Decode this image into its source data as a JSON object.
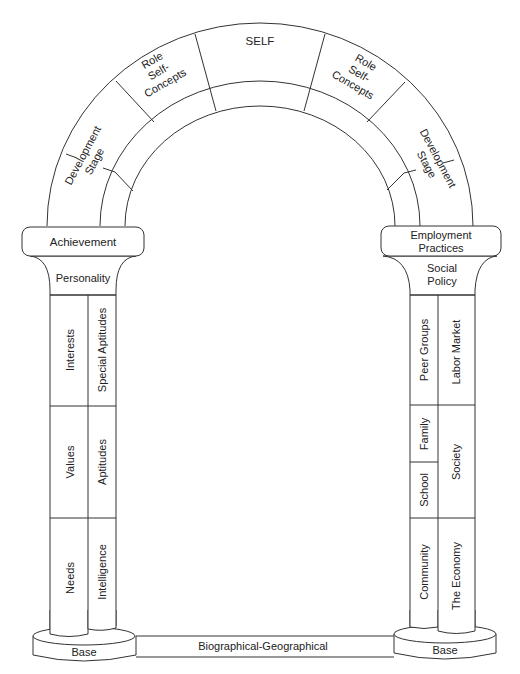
{
  "diagram": {
    "type": "archway",
    "arch": {
      "keystone": "SELF",
      "left_segments": [
        "Role Self-Concepts",
        "Development Stage"
      ],
      "right_segments": [
        "Role Self-Concepts",
        "Development Stage"
      ],
      "labels": {
        "self": "SELF",
        "role_left": [
          "Role",
          "Self-",
          "Concepts"
        ],
        "role_right": [
          "Role",
          "Self-",
          "Concepts"
        ],
        "dev_left": [
          "Development",
          "Stage"
        ],
        "dev_right": [
          "Development",
          "Stage"
        ]
      }
    },
    "left_pillar": {
      "capital": "Achievement",
      "neck": "Personality",
      "column_left": [
        "Interests",
        "Values",
        "Needs"
      ],
      "column_right": [
        "Special Aptitudes",
        "Aptitudes",
        "Intelligence"
      ],
      "base": "Base"
    },
    "right_pillar": {
      "capital": [
        "Employment",
        "Practices"
      ],
      "neck": [
        "Social",
        "Policy"
      ],
      "column_left": [
        "Peer Groups",
        "Family",
        "School",
        "Community"
      ],
      "column_right": [
        "Labor Market",
        "Society",
        "The Economy"
      ],
      "base": "Base"
    },
    "foundation": "Biographical-Geographical",
    "colors": {
      "line": "#333333",
      "text": "#222222",
      "background": "#ffffff"
    }
  }
}
